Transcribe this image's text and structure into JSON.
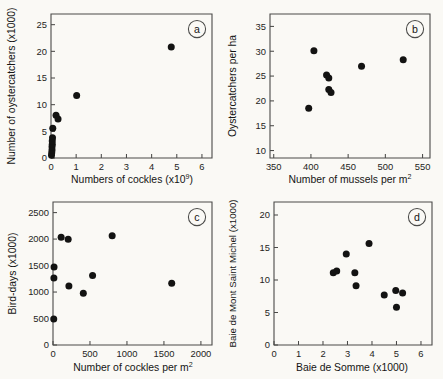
{
  "figure": {
    "name": "four-panel-scatter-figure",
    "background_color": "#faf9f5",
    "point_color": "#131312",
    "axis_color": "#4a4a48"
  },
  "chart_data": [
    {
      "type": "scatter",
      "panel": "a",
      "title": "",
      "xlabel": "Numbers of cockles (x10⁹)",
      "xlabel_base": "Numbers of cockles (x10",
      "xlabel_sup": "9",
      "xlabel_tail": ")",
      "ylabel": "Number of oystercatchers (x1000)",
      "xlim": [
        0,
        6.4
      ],
      "ylim": [
        0,
        27
      ],
      "xticks": [
        0,
        1,
        2,
        3,
        4,
        5,
        6
      ],
      "yticks": [
        0,
        5,
        10,
        15,
        20,
        25
      ],
      "xticklabels": [
        "0",
        "1",
        "2",
        "3",
        "4",
        "5",
        "6"
      ],
      "yticklabels": [
        "0",
        "5",
        "10",
        "15",
        "20",
        "25"
      ],
      "grid": false,
      "legend": "none",
      "points": [
        {
          "x": 0.02,
          "y": 0.5
        },
        {
          "x": 0.03,
          "y": 1.0
        },
        {
          "x": 0.04,
          "y": 1.5
        },
        {
          "x": 0.04,
          "y": 2.1
        },
        {
          "x": 0.05,
          "y": 2.6
        },
        {
          "x": 0.05,
          "y": 3.2
        },
        {
          "x": 0.06,
          "y": 3.8
        },
        {
          "x": 0.07,
          "y": 5.6
        },
        {
          "x": 0.2,
          "y": 8.0
        },
        {
          "x": 0.28,
          "y": 7.3
        },
        {
          "x": 1.02,
          "y": 11.7
        },
        {
          "x": 4.78,
          "y": 20.8
        }
      ]
    },
    {
      "type": "scatter",
      "panel": "b",
      "title": "",
      "xlabel": "Number of mussels per m²",
      "xlabel_base": "Number of mussels per m",
      "xlabel_sup": "2",
      "xlabel_tail": "",
      "ylabel": "Oystercatchers per ha",
      "xlim": [
        345,
        560
      ],
      "ylim": [
        8.5,
        37.5
      ],
      "xticks": [
        350,
        400,
        450,
        500,
        550
      ],
      "yticks": [
        10,
        15,
        20,
        25,
        30,
        35
      ],
      "xticklabels": [
        "350",
        "400",
        "450",
        "500",
        "550"
      ],
      "yticklabels": [
        "10",
        "15",
        "20",
        "25",
        "30",
        "35"
      ],
      "grid": false,
      "legend": "none",
      "points": [
        {
          "x": 397,
          "y": 18.5
        },
        {
          "x": 404,
          "y": 30.1
        },
        {
          "x": 421,
          "y": 25.2
        },
        {
          "x": 424,
          "y": 24.6
        },
        {
          "x": 424,
          "y": 22.3
        },
        {
          "x": 427,
          "y": 21.7
        },
        {
          "x": 468,
          "y": 27.0
        },
        {
          "x": 524,
          "y": 28.3
        }
      ]
    },
    {
      "type": "scatter",
      "panel": "c",
      "title": "",
      "xlabel": "Number of cockles per m²",
      "xlabel_base": "Number of cockles per m",
      "xlabel_sup": "2",
      "xlabel_tail": "",
      "ylabel": "Bird-days (x1000)",
      "xlim": [
        0,
        2150
      ],
      "ylim": [
        0,
        2700
      ],
      "xticks": [
        0,
        500,
        1000,
        1500,
        2000
      ],
      "yticks": [
        0,
        500,
        1000,
        1500,
        2000,
        2500
      ],
      "xticklabels": [
        "0",
        "500",
        "1000",
        "1500",
        "2000"
      ],
      "yticklabels": [
        "0",
        "500",
        "1000",
        "1500",
        "2000",
        "2500"
      ],
      "grid": false,
      "legend": "none",
      "points": [
        {
          "x": 10,
          "y": 490
        },
        {
          "x": 12,
          "y": 1265
        },
        {
          "x": 14,
          "y": 1475
        },
        {
          "x": 110,
          "y": 2035
        },
        {
          "x": 205,
          "y": 1995
        },
        {
          "x": 215,
          "y": 1115
        },
        {
          "x": 410,
          "y": 975
        },
        {
          "x": 535,
          "y": 1310
        },
        {
          "x": 800,
          "y": 2065
        },
        {
          "x": 1605,
          "y": 1165
        }
      ]
    },
    {
      "type": "scatter",
      "panel": "d",
      "title": "",
      "xlabel": "Baie de Somme (x1000)",
      "xlabel_base": "Baie de Somme (x1000)",
      "xlabel_sup": "",
      "xlabel_tail": "",
      "ylabel": "Baie de Mont Saint Michel (x1000)",
      "xlim": [
        0,
        6.45
      ],
      "ylim": [
        0,
        22
      ],
      "xticks": [
        0,
        1,
        2,
        3,
        4,
        5,
        6
      ],
      "yticks": [
        0,
        5,
        10,
        15,
        20
      ],
      "xticklabels": [
        "0",
        "1",
        "2",
        "3",
        "4",
        "5",
        "6"
      ],
      "yticklabels": [
        "0",
        "5",
        "10",
        "15",
        "20"
      ],
      "grid": false,
      "legend": "none",
      "points": [
        {
          "x": 2.42,
          "y": 11.1
        },
        {
          "x": 2.56,
          "y": 11.4
        },
        {
          "x": 2.95,
          "y": 14.0
        },
        {
          "x": 3.3,
          "y": 11.1
        },
        {
          "x": 3.35,
          "y": 9.1
        },
        {
          "x": 3.88,
          "y": 15.6
        },
        {
          "x": 4.5,
          "y": 7.7
        },
        {
          "x": 4.97,
          "y": 8.4
        },
        {
          "x": 5.0,
          "y": 5.8
        },
        {
          "x": 5.25,
          "y": 8.0
        }
      ]
    }
  ],
  "panel_labels": {
    "a": "a",
    "b": "b",
    "c": "c",
    "d": "d"
  }
}
